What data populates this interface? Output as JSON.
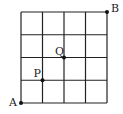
{
  "diagram": {
    "grid": {
      "cols": 4,
      "rows": 4,
      "left": 21,
      "top": 12,
      "right": 107,
      "bottom": 103,
      "stroke": "#222222"
    },
    "points": [
      {
        "label": "A",
        "col": 0,
        "row": 0,
        "label_dx": -12,
        "label_dy": 3
      },
      {
        "label": "P",
        "col": 1,
        "row": 1,
        "label_dx": -9,
        "label_dy": -3
      },
      {
        "label": "Q",
        "col": 2,
        "row": 2,
        "label_dx": -9,
        "label_dy": -3
      },
      {
        "label": "B",
        "col": 4,
        "row": 4,
        "label_dx": 4,
        "label_dy": 0
      }
    ]
  }
}
